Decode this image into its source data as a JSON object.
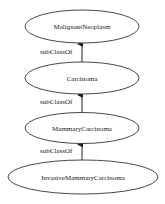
{
  "diagram": {
    "type": "class-hierarchy",
    "colors": {
      "stroke": "#333333",
      "text": "#222222",
      "background": "#ffffff"
    },
    "nodes": [
      {
        "id": "n0",
        "label": "MalignantNeoplasm",
        "cx": 82,
        "cy": 26.5,
        "rx": 57,
        "ry": 16.5
      },
      {
        "id": "n1",
        "label": "Carcinoma",
        "cx": 82,
        "cy": 78,
        "rx": 57,
        "ry": 16
      },
      {
        "id": "n2",
        "label": "MammaryCarcinoma",
        "cx": 82,
        "cy": 128,
        "rx": 57,
        "ry": 15.5
      },
      {
        "id": "n3",
        "label": "InvasiveMammaryCarcinoma",
        "cx": 83,
        "cy": 177,
        "rx": 75,
        "ry": 17
      }
    ],
    "edges": [
      {
        "from": "Carcinoma",
        "to": "MalignantNeoplasm",
        "label": "subClassOf",
        "x": 82,
        "y1": 62,
        "y2": 43,
        "lx": 40,
        "ly": 54
      },
      {
        "from": "MammaryCarcinoma",
        "to": "Carcinoma",
        "label": "subClassOf",
        "x": 82,
        "y1": 112.5,
        "y2": 94,
        "lx": 40,
        "ly": 104
      },
      {
        "from": "InvasiveMammaryCarcinoma",
        "to": "MammaryCarcinoma",
        "label": "subClassOf",
        "x": 82,
        "y1": 160,
        "y2": 143.5,
        "lx": 40,
        "ly": 153
      }
    ]
  }
}
